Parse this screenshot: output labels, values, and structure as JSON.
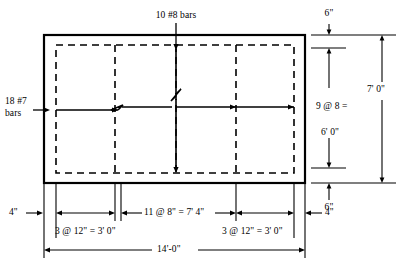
{
  "figure": {
    "type": "structural-engineering-reinforcement-plan"
  },
  "annotations": {
    "top_bars": "10 #8 bars",
    "left_bars_line1": "18 #7",
    "left_bars_line2": "bars"
  },
  "dimensions": {
    "right_top_cover": "6\"",
    "right_spacing_line1": "9 @ 8 =",
    "right_spacing_line2": "6' 0\"",
    "right_bottom_cover": "6\"",
    "right_overall": "7' 0\"",
    "bottom_left_cover": "4\"",
    "bottom_right_cover": "4\"",
    "bottom_left_group": "3 @ 12\" = 3' 0\"",
    "bottom_middle_group": "11 @ 8\" = 7' 4\"",
    "bottom_right_group": "3 @ 12\" = 3' 0\"",
    "bottom_overall": "14'-0\""
  },
  "colors": {
    "line": "#000000",
    "background": "#ffffff"
  }
}
